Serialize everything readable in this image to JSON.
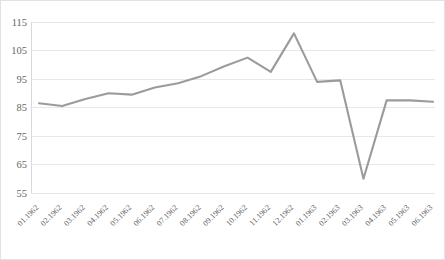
{
  "chart_data": {
    "type": "line",
    "title": "",
    "subtitle": "",
    "xlabel": "",
    "ylabel": "",
    "categories": [
      "01.1962",
      "02.1962",
      "03.1962",
      "04.1962",
      "05.1962",
      "06.1962",
      "07.1962",
      "08.1962",
      "09.1962",
      "10.1962",
      "11.1962",
      "12.1962",
      "01.1963",
      "02.1963",
      "03.1963",
      "04.1963",
      "05.1963",
      "06.1963"
    ],
    "values": [
      86.5,
      85.5,
      88.0,
      90.0,
      89.5,
      92.0,
      93.5,
      96.0,
      99.5,
      102.5,
      97.5,
      111.0,
      94.0,
      94.5,
      60.0,
      87.5,
      87.5,
      87.0
    ],
    "series": [
      {
        "name": "Series 1",
        "color": "#9b9b9b",
        "values": [
          86.5,
          85.5,
          88.0,
          90.0,
          89.5,
          92.0,
          93.5,
          96.0,
          99.5,
          102.5,
          97.5,
          111.0,
          94.0,
          94.5,
          60.0,
          87.5,
          87.5,
          87.0
        ]
      }
    ],
    "ylim": [
      55,
      115
    ],
    "yticks": [
      55,
      65,
      75,
      85,
      95,
      105,
      115
    ],
    "ytick_labels": [
      "55",
      "65",
      "75",
      "85",
      "95",
      "105",
      "115"
    ],
    "grid": "horizontal",
    "legend": "none",
    "markers": "none",
    "xtick_rotation": -45,
    "annotations": []
  },
  "style": {
    "line_color": "#9b9b9b",
    "gridline_color": "#e8e8e8",
    "axis_color": "#d9d9d9",
    "tick_label_color": "#666666",
    "background": "#ffffff",
    "border_color": "#e2e2e2"
  }
}
